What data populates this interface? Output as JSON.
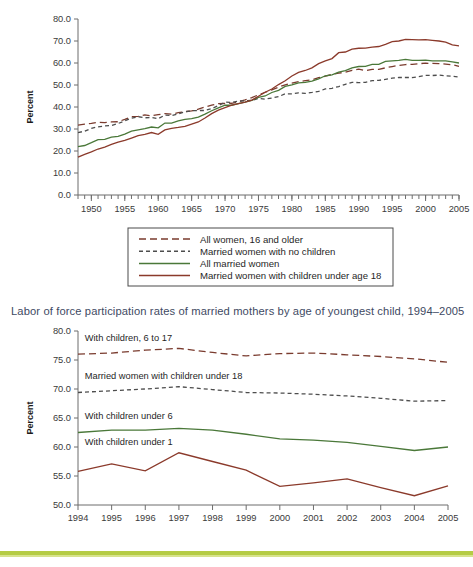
{
  "chart_data": [
    {
      "id": "chart1",
      "type": "line",
      "title": "",
      "xlabel": "",
      "ylabel": "Percent",
      "xlim": [
        1948,
        2005
      ],
      "ylim": [
        0,
        80
      ],
      "yticks": [
        "0.0",
        "10.0",
        "20.0",
        "30.0",
        "40.0",
        "50.0",
        "60.0",
        "70.0",
        "80.0"
      ],
      "xticks": [
        "1950",
        "1955",
        "1960",
        "1965",
        "1970",
        "1975",
        "1980",
        "1985",
        "1990",
        "1995",
        "2000",
        "2005"
      ],
      "grid": false,
      "legend_position": "below",
      "series": [
        {
          "name": "All women, 16 and older",
          "style": "dashed-long",
          "color": "#7a3b2e",
          "x": [
            1948,
            1949,
            1950,
            1951,
            1952,
            1953,
            1954,
            1955,
            1956,
            1957,
            1958,
            1959,
            1960,
            1961,
            1962,
            1963,
            1964,
            1965,
            1966,
            1967,
            1968,
            1969,
            1970,
            1971,
            1972,
            1973,
            1974,
            1975,
            1976,
            1977,
            1978,
            1979,
            1980,
            1981,
            1982,
            1983,
            1984,
            1985,
            1986,
            1987,
            1988,
            1989,
            1990,
            1991,
            1992,
            1993,
            1994,
            1995,
            1996,
            1997,
            1998,
            1999,
            2000,
            2001,
            2002,
            2003,
            2004,
            2005
          ],
          "values": [
            31.8,
            32.2,
            32.6,
            33.1,
            32.9,
            33.2,
            33.3,
            34.4,
            35.6,
            35.7,
            36.4,
            36.0,
            36.5,
            37.0,
            36.8,
            37.4,
            37.9,
            38.2,
            39.0,
            40.0,
            40.8,
            41.5,
            41.6,
            41.7,
            42.4,
            43.2,
            44.3,
            45.5,
            46.7,
            47.8,
            49.0,
            50.1,
            50.8,
            51.5,
            52.0,
            52.4,
            53.3,
            54.0,
            54.8,
            55.4,
            55.8,
            56.7,
            57.2,
            56.5,
            57.1,
            57.1,
            57.8,
            58.4,
            58.9,
            59.3,
            59.4,
            59.7,
            59.9,
            59.8,
            59.7,
            59.5,
            59.2,
            58.5
          ]
        },
        {
          "name": "Married women with no children",
          "style": "dashed-short",
          "color": "#4d4d4d",
          "x": [
            1948,
            1949,
            1950,
            1951,
            1952,
            1953,
            1954,
            1955,
            1956,
            1957,
            1958,
            1959,
            1960,
            1961,
            1962,
            1963,
            1964,
            1965,
            1966,
            1967,
            1968,
            1969,
            1970,
            1971,
            1972,
            1973,
            1974,
            1975,
            1976,
            1977,
            1978,
            1979,
            1980,
            1981,
            1982,
            1983,
            1984,
            1985,
            1986,
            1987,
            1988,
            1989,
            1990,
            1991,
            1992,
            1993,
            1994,
            1995,
            1996,
            1997,
            1998,
            1999,
            2000,
            2001,
            2002,
            2003,
            2004,
            2005
          ],
          "values": [
            28.4,
            29.0,
            30.3,
            31.0,
            31.4,
            31.6,
            32.5,
            33.7,
            34.9,
            35.6,
            35.1,
            35.2,
            34.7,
            36.3,
            36.1,
            36.9,
            37.8,
            38.3,
            38.4,
            38.4,
            39.3,
            40.6,
            42.2,
            42.1,
            42.7,
            42.8,
            43.0,
            43.9,
            43.6,
            44.1,
            44.7,
            46.0,
            46.0,
            46.4,
            46.2,
            46.6,
            47.1,
            48.2,
            48.5,
            49.3,
            50.3,
            51.2,
            51.1,
            51.2,
            52.0,
            52.1,
            52.6,
            53.1,
            53.4,
            53.4,
            53.4,
            53.8,
            54.4,
            54.3,
            54.5,
            54.2,
            54.0,
            53.6
          ]
        },
        {
          "name": "All married women",
          "style": "solid",
          "color": "#4a7839",
          "x": [
            1948,
            1949,
            1950,
            1951,
            1952,
            1953,
            1954,
            1955,
            1956,
            1957,
            1958,
            1959,
            1960,
            1961,
            1962,
            1963,
            1964,
            1965,
            1966,
            1967,
            1968,
            1969,
            1970,
            1971,
            1972,
            1973,
            1974,
            1975,
            1976,
            1977,
            1978,
            1979,
            1980,
            1981,
            1982,
            1983,
            1984,
            1985,
            1986,
            1987,
            1988,
            1989,
            1990,
            1991,
            1992,
            1993,
            1994,
            1995,
            1996,
            1997,
            1998,
            1999,
            2000,
            2001,
            2002,
            2003,
            2004,
            2005
          ],
          "values": [
            22.0,
            22.5,
            23.8,
            25.2,
            25.3,
            26.3,
            26.6,
            27.7,
            29.0,
            29.6,
            30.2,
            30.9,
            30.5,
            32.7,
            32.7,
            33.7,
            34.4,
            34.7,
            35.4,
            36.8,
            38.3,
            39.6,
            40.8,
            40.8,
            41.5,
            42.2,
            43.0,
            44.4,
            45.0,
            46.6,
            47.6,
            49.4,
            50.1,
            51.0,
            51.2,
            51.8,
            52.8,
            54.2,
            54.6,
            55.8,
            56.5,
            57.8,
            58.4,
            58.5,
            59.4,
            59.4,
            60.7,
            61.0,
            61.2,
            61.6,
            61.2,
            61.2,
            61.3,
            61.0,
            61.0,
            61.0,
            60.5,
            60.0
          ]
        },
        {
          "name": "Married women with children under age 18",
          "style": "solid",
          "color": "#8b3a2b",
          "x": [
            1948,
            1949,
            1950,
            1951,
            1952,
            1953,
            1954,
            1955,
            1956,
            1957,
            1958,
            1959,
            1960,
            1961,
            1962,
            1963,
            1964,
            1965,
            1966,
            1967,
            1968,
            1969,
            1970,
            1971,
            1972,
            1973,
            1974,
            1975,
            1976,
            1977,
            1978,
            1979,
            1980,
            1981,
            1982,
            1983,
            1984,
            1985,
            1986,
            1987,
            1988,
            1989,
            1990,
            1991,
            1992,
            1993,
            1994,
            1995,
            1996,
            1997,
            1998,
            1999,
            2000,
            2001,
            2002,
            2003,
            2004,
            2005
          ],
          "values": [
            17.2,
            18.5,
            19.6,
            20.9,
            21.8,
            23.0,
            24.0,
            24.8,
            25.9,
            27.0,
            27.6,
            28.4,
            27.6,
            29.6,
            30.3,
            30.7,
            31.2,
            32.2,
            33.2,
            35.0,
            37.0,
            38.6,
            39.7,
            40.8,
            41.5,
            42.2,
            43.1,
            44.9,
            46.7,
            48.2,
            50.2,
            51.9,
            54.1,
            55.7,
            56.6,
            57.8,
            59.7,
            61.0,
            62.0,
            64.7,
            65.0,
            66.3,
            66.7,
            66.8,
            67.2,
            67.5,
            68.5,
            69.7,
            70.0,
            70.7,
            70.6,
            70.5,
            70.6,
            70.3,
            70.0,
            69.5,
            68.2,
            67.8
          ]
        }
      ]
    },
    {
      "id": "chart2",
      "type": "line",
      "title": "Labor of force participation rates of married mothers by age of youngest child, 1994–2005",
      "xlabel": "",
      "ylabel": "Percent",
      "xlim": [
        1994,
        2005
      ],
      "ylim": [
        50,
        80
      ],
      "yticks": [
        "50.0",
        "55.0",
        "60.0",
        "65.0",
        "70.0",
        "75.0",
        "80.0"
      ],
      "xticks": [
        "1994",
        "1995",
        "1996",
        "1997",
        "1998",
        "1999",
        "2000",
        "2001",
        "2002",
        "2003",
        "2004",
        "2005"
      ],
      "grid": false,
      "legend_position": "inline-labels",
      "series": [
        {
          "name": "With children, 6 to 17",
          "style": "dashed-long",
          "color": "#7a3b2e",
          "x": [
            1994,
            1995,
            1996,
            1997,
            1998,
            1999,
            2000,
            2001,
            2002,
            2003,
            2004,
            2005
          ],
          "values": [
            76.0,
            76.2,
            76.7,
            77.0,
            76.3,
            75.7,
            76.1,
            76.2,
            75.9,
            75.6,
            75.2,
            74.6
          ]
        },
        {
          "name": "Married women with children under 18",
          "style": "dashed-short",
          "color": "#4d4d4d",
          "x": [
            1994,
            1995,
            1996,
            1997,
            1998,
            1999,
            2000,
            2001,
            2002,
            2003,
            2004,
            2005
          ],
          "values": [
            69.4,
            69.7,
            70.0,
            70.4,
            69.9,
            69.4,
            69.3,
            69.1,
            68.8,
            68.4,
            67.9,
            68.0
          ]
        },
        {
          "name": "With children under 6",
          "style": "solid",
          "color": "#4a7839",
          "x": [
            1994,
            1995,
            1996,
            1997,
            1998,
            1999,
            2000,
            2001,
            2002,
            2003,
            2004,
            2005
          ],
          "values": [
            62.5,
            62.9,
            62.9,
            63.2,
            62.9,
            62.2,
            61.4,
            61.2,
            60.8,
            60.1,
            59.4,
            60.0
          ]
        },
        {
          "name": "With children under 1",
          "style": "solid",
          "color": "#8b3a2b",
          "x": [
            1994,
            1995,
            1996,
            1997,
            1998,
            1999,
            2000,
            2001,
            2002,
            2003,
            2004,
            2005
          ],
          "values": [
            55.8,
            57.1,
            55.9,
            59.0,
            57.5,
            56.0,
            53.2,
            53.8,
            54.5,
            53.0,
            51.6,
            53.3
          ]
        }
      ],
      "inline_labels": [
        {
          "text": "With children, 6 to 17",
          "year": 1994.2,
          "value": 78.2
        },
        {
          "text": "Married women with children under 18",
          "year": 1994.2,
          "value": 71.7
        },
        {
          "text": "With children under 6",
          "year": 1994.2,
          "value": 64.8
        },
        {
          "text": "With children under 1",
          "year": 1994.2,
          "value": 60.4
        }
      ]
    }
  ],
  "chart1_legend": {
    "items": [
      {
        "label": "All women, 16 and older",
        "style": "dashed-long",
        "color": "#7a3b2e"
      },
      {
        "label": "Married women with no children",
        "style": "dashed-short",
        "color": "#4d4d4d"
      },
      {
        "label": "All married women",
        "style": "solid",
        "color": "#4a7839"
      },
      {
        "label": "Married women with children under age 18",
        "style": "solid",
        "color": "#8b3a2b"
      }
    ]
  },
  "colors": {
    "all_women": "#7a3b2e",
    "married_no_children": "#4d4d4d",
    "all_married": "#4a7839",
    "married_with_children": "#8b3a2b",
    "accent_bar": "#b5cc45",
    "title_text": "#3e4a63"
  }
}
